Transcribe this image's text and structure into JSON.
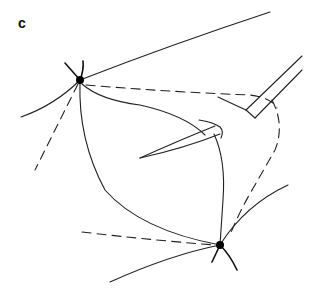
{
  "figure": {
    "panel_label": "c",
    "colors": {
      "line": "#222222",
      "node": "#000000",
      "background": "#ffffff"
    },
    "nodes": [
      {
        "id": "node-top-left",
        "x": 80,
        "y": 80
      },
      {
        "id": "node-bottom-right",
        "x": 220,
        "y": 245
      }
    ]
  }
}
